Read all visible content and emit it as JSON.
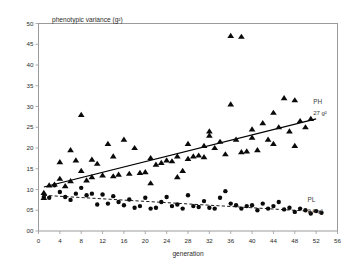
{
  "chart_data": {
    "type": "scatter",
    "title": "",
    "xlabel": "generation",
    "ylabel": "phenotypic variance (g²)",
    "xlim": [
      0,
      56
    ],
    "ylim": [
      0,
      50
    ],
    "xticks": [
      "0",
      "4",
      "8",
      "12",
      "16",
      "20",
      "24",
      "28",
      "32",
      "36",
      "40",
      "44",
      "48",
      "52",
      "56"
    ],
    "yticks": [
      "00",
      "05",
      "10",
      "15",
      "20",
      "25",
      "30",
      "35",
      "40",
      "45",
      "50"
    ],
    "grid": false,
    "legend_position": "inline-right",
    "series": [
      {
        "name": "PH",
        "marker": "triangle",
        "label": "PH",
        "value_label": "27 g²",
        "trendline": "solid",
        "trend_start": [
          1.0,
          10.6
        ],
        "trend_end": [
          52.0,
          27.0
        ],
        "points": [
          [
            1,
            8.0
          ],
          [
            1,
            9.2
          ],
          [
            2,
            11.0
          ],
          [
            3,
            11.2
          ],
          [
            4,
            12.6
          ],
          [
            4,
            16.6
          ],
          [
            5,
            10.8
          ],
          [
            6,
            19.5
          ],
          [
            6,
            12.0
          ],
          [
            7,
            17.0
          ],
          [
            8,
            14.5
          ],
          [
            8,
            28.0
          ],
          [
            9,
            12.2
          ],
          [
            10,
            17.2
          ],
          [
            10,
            13.0
          ],
          [
            11,
            16.2
          ],
          [
            12,
            13.4
          ],
          [
            13,
            21.0
          ],
          [
            14,
            18.0
          ],
          [
            14,
            13.2
          ],
          [
            15,
            13.6
          ],
          [
            16,
            22.0
          ],
          [
            17,
            13.8
          ],
          [
            18,
            20.0
          ],
          [
            19,
            14.0
          ],
          [
            20,
            14.2
          ],
          [
            21,
            11.5
          ],
          [
            21,
            17.6
          ],
          [
            22,
            16.0
          ],
          [
            23,
            16.4
          ],
          [
            24,
            17.0
          ],
          [
            25,
            16.8
          ],
          [
            26,
            18.0
          ],
          [
            26,
            13.0
          ],
          [
            27,
            14.5
          ],
          [
            28,
            21.0
          ],
          [
            28,
            17.4
          ],
          [
            29,
            18.0
          ],
          [
            30,
            18.2
          ],
          [
            31,
            20.5
          ],
          [
            31,
            17.8
          ],
          [
            32,
            23.0
          ],
          [
            32,
            24.0
          ],
          [
            33,
            20.0
          ],
          [
            34,
            21.5
          ],
          [
            35,
            18.5
          ],
          [
            36,
            30.5
          ],
          [
            36,
            47.0
          ],
          [
            37,
            22.0
          ],
          [
            38,
            46.8
          ],
          [
            38,
            19.0
          ],
          [
            39,
            19.2
          ],
          [
            40,
            24.5
          ],
          [
            40,
            22.5
          ],
          [
            41,
            19.5
          ],
          [
            42,
            26.0
          ],
          [
            43,
            22.0
          ],
          [
            44,
            28.5
          ],
          [
            44,
            21.0
          ],
          [
            45,
            25.0
          ],
          [
            46,
            32.0
          ],
          [
            47,
            24.0
          ],
          [
            48,
            31.5
          ],
          [
            48,
            20.5
          ],
          [
            49,
            26.5
          ],
          [
            50,
            25.0
          ],
          [
            51,
            27.0
          ]
        ]
      },
      {
        "name": "PL",
        "marker": "circle",
        "label": "PL",
        "value_label": "2.6 g²",
        "trendline": "dashed",
        "trend_start": [
          1.0,
          8.6
        ],
        "trend_end": [
          53.0,
          4.6
        ],
        "points": [
          [
            1,
            8.2
          ],
          [
            2,
            8.0
          ],
          [
            3,
            11.0
          ],
          [
            4,
            9.4
          ],
          [
            5,
            8.2
          ],
          [
            6,
            7.5
          ],
          [
            7,
            9.0
          ],
          [
            8,
            10.4
          ],
          [
            9,
            8.6
          ],
          [
            10,
            9.0
          ],
          [
            11,
            6.4
          ],
          [
            12,
            8.8
          ],
          [
            13,
            6.6
          ],
          [
            14,
            8.4
          ],
          [
            15,
            7.0
          ],
          [
            16,
            6.2
          ],
          [
            17,
            7.6
          ],
          [
            18,
            5.6
          ],
          [
            19,
            6.0
          ],
          [
            20,
            8.0
          ],
          [
            21,
            5.4
          ],
          [
            22,
            5.6
          ],
          [
            23,
            7.0
          ],
          [
            24,
            8.2
          ],
          [
            25,
            6.0
          ],
          [
            26,
            6.4
          ],
          [
            27,
            5.4
          ],
          [
            28,
            8.6
          ],
          [
            29,
            6.0
          ],
          [
            30,
            5.8
          ],
          [
            31,
            7.2
          ],
          [
            32,
            5.6
          ],
          [
            33,
            5.4
          ],
          [
            34,
            8.0
          ],
          [
            35,
            9.6
          ],
          [
            36,
            6.6
          ],
          [
            37,
            6.2
          ],
          [
            38,
            5.4
          ],
          [
            39,
            6.0
          ],
          [
            40,
            6.2
          ],
          [
            41,
            5.0
          ],
          [
            42,
            6.6
          ],
          [
            43,
            5.4
          ],
          [
            44,
            6.0
          ],
          [
            45,
            7.0
          ],
          [
            46,
            5.2
          ],
          [
            47,
            5.6
          ],
          [
            48,
            4.6
          ],
          [
            49,
            5.4
          ],
          [
            50,
            5.0
          ],
          [
            51,
            4.2
          ],
          [
            52,
            4.8
          ],
          [
            53,
            4.4
          ]
        ]
      }
    ]
  },
  "axes": {
    "x_title": "generation",
    "y_title": "phenotypic variance (g²)"
  },
  "annotations": {
    "ph_label": "PH",
    "ph_value": "27 g²",
    "pl_label": "PL",
    "pl_value": "2.6 g²"
  },
  "colors": {
    "marker": "#0a0a0a",
    "frame": "#9b9b9b",
    "text": "#2b2b2b"
  }
}
